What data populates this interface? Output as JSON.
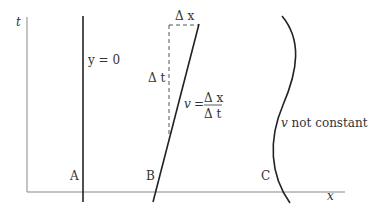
{
  "axes": {
    "vertical_label": "t",
    "horizontal_label": "x"
  },
  "worldlines": {
    "A": {
      "letter": "A",
      "annotation": "y = 0"
    },
    "B": {
      "letter": "B",
      "delta_x": "Δ x",
      "delta_t": "Δ t",
      "v_symbol": "v",
      "equals": "=",
      "frac_num": "Δ x",
      "frac_den": "Δ t"
    },
    "C": {
      "letter": "C",
      "annotation_v": "v",
      "annotation_rest": " not constant"
    }
  },
  "colors": {
    "axis": "#888888",
    "line": "#222222",
    "dashed": "#555555"
  }
}
